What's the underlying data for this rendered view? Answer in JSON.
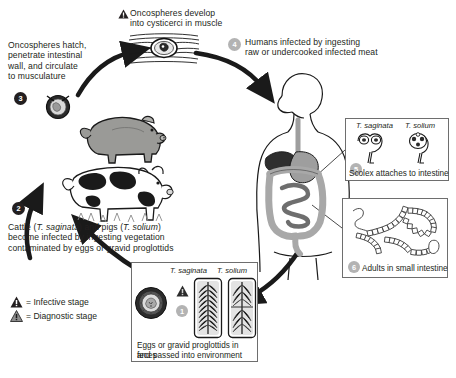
{
  "steps": {
    "s1": {
      "num": "1",
      "tone": "gray"
    },
    "s2": {
      "num": "2",
      "tone": "dark"
    },
    "s3": {
      "num": "3",
      "tone": "dark"
    },
    "s4": {
      "num": "4",
      "tone": "gray"
    },
    "s5": {
      "num": "5",
      "tone": "gray"
    },
    "s6": {
      "num": "6",
      "tone": "gray"
    }
  },
  "labels": {
    "top_line1": "Oncospheres develop",
    "top_line2": "into cysticerci in muscle",
    "left_line1": "Oncospheres hatch,",
    "left_line2": "penetrate intestinal",
    "left_line3": "wall, and circulate",
    "left_line4": "to musculature",
    "step4_line1": "Humans infected by ingesting",
    "step4_line2": "raw or undercooked infected meat",
    "step2_line1_a": "Cattle (",
    "step2_line1_i1": "T. saginata",
    "step2_line1_b": ") and pigs (",
    "step2_line1_i2": "T. solium",
    "step2_line1_c": ")",
    "step2_line2": "become infected by ingesting vegetation",
    "step2_line3": "contaminated by eggs or gravid proglottids"
  },
  "legend": {
    "infective": "= Infective stage",
    "diagnostic": "= Diagnostic stage"
  },
  "panels": {
    "scolex": {
      "species_left": "T. saginata",
      "species_right": "T. solium",
      "caption": "Scolex attaches to intestine"
    },
    "adults": {
      "caption": "Adults in small intestine"
    },
    "eggs": {
      "species_left": "T. saginata",
      "species_right": "T. solium",
      "caption_line1": "Eggs or gravid proglottids in feces",
      "caption_line2": "and passed into environment"
    }
  },
  "colors": {
    "ink": "#231f20",
    "gray_badge": "#b3b3b3",
    "panel_border": "#6e6e6e",
    "pig": "#9a9a97",
    "cow_body": "#ffffff",
    "organ_light": "#c9c9c9",
    "organ_mid": "#9e9e9e",
    "organ_dark": "#3a3a3a",
    "background": "#ffffff"
  },
  "icons": {
    "infective_triangle": "warning-triangle-filled-icon",
    "diagnostic_triangle": "warning-triangle-gray-icon",
    "cysticercus": "cysticercus-in-muscle-icon",
    "oncosphere": "oncosphere-egg-icon",
    "pig": "pig-icon",
    "cow": "cow-icon",
    "human": "human-body-icon",
    "scolex_saginata": "scolex-saginata-icon",
    "scolex_solium": "scolex-solium-icon",
    "adult_worms": "adult-tapeworms-icon",
    "egg": "taenia-egg-icon",
    "proglottid_saginata": "proglottid-saginata-icon",
    "proglottid_solium": "proglottid-solium-icon"
  }
}
